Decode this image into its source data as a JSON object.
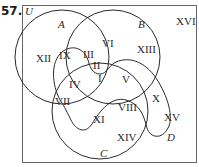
{
  "problem": {
    "number": "57."
  },
  "universe": {
    "label": "U"
  },
  "sets": [
    {
      "name": "A",
      "label": "A"
    },
    {
      "name": "B",
      "label": "B"
    },
    {
      "name": "C",
      "label": "C"
    },
    {
      "name": "D",
      "label": "D"
    }
  ],
  "regions": {
    "r1": "I",
    "r2": "II",
    "r3": "III",
    "r4": "IV",
    "r5": "V",
    "r6": "VI",
    "r7": "VII",
    "r8": "VIII",
    "r9": "IX",
    "r10": "X",
    "r11": "XI",
    "r12": "XII",
    "r13": "XIII",
    "r14": "XIV",
    "r15": "XV",
    "r16": "XVI"
  },
  "colors": {
    "stroke": "#2a2a2a",
    "frame": "#555555",
    "background": "#ffffff"
  }
}
